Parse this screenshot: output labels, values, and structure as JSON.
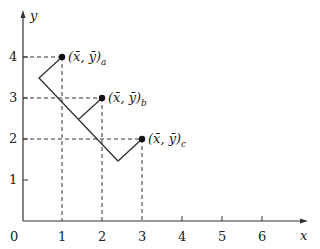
{
  "axes": {
    "x_label": "x",
    "y_label": "y",
    "origin_label": "0",
    "x_ticks": [
      "1",
      "2",
      "3",
      "4",
      "5",
      "6"
    ],
    "y_ticks": [
      "1",
      "2",
      "3",
      "4"
    ]
  },
  "points": [
    {
      "id": "a",
      "x": 1,
      "y": 4,
      "label": "(x̄, ȳ)",
      "subscript": "a"
    },
    {
      "id": "b",
      "x": 2,
      "y": 3,
      "label": "(x̄, ȳ)",
      "subscript": "b"
    },
    {
      "id": "c",
      "x": 3,
      "y": 2,
      "label": "(x̄, ȳ)",
      "subscript": "c"
    }
  ],
  "zigzag_path": [
    {
      "x": 1,
      "y": 4
    },
    {
      "x": 0.4,
      "y": 3.45
    },
    {
      "x": 2.4,
      "y": 1.45
    },
    {
      "x": 3,
      "y": 2
    }
  ],
  "branch_path": [
    {
      "x": 1.4,
      "y": 2.45
    },
    {
      "x": 2,
      "y": 3
    }
  ]
}
